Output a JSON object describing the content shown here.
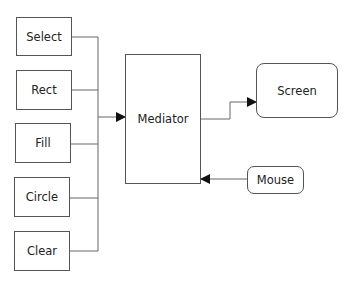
{
  "diagram": {
    "type": "mediator-pattern-block-diagram",
    "commands": [
      {
        "id": "select",
        "label": "Select"
      },
      {
        "id": "rect",
        "label": "Rect"
      },
      {
        "id": "fill",
        "label": "Fill"
      },
      {
        "id": "circle",
        "label": "Circle"
      },
      {
        "id": "clear",
        "label": "Clear"
      }
    ],
    "mediator": {
      "label": "Mediator"
    },
    "screen": {
      "label": "Screen"
    },
    "mouse": {
      "label": "Mouse"
    },
    "edges": [
      {
        "from": "commands",
        "to": "mediator",
        "style": "bus-arrow"
      },
      {
        "from": "mediator",
        "to": "screen",
        "style": "elbow-arrow"
      },
      {
        "from": "mouse",
        "to": "mediator",
        "style": "arrow"
      }
    ],
    "colors": {
      "stroke": "#555555",
      "arrow": "#111111",
      "background": "#ffffff"
    }
  }
}
